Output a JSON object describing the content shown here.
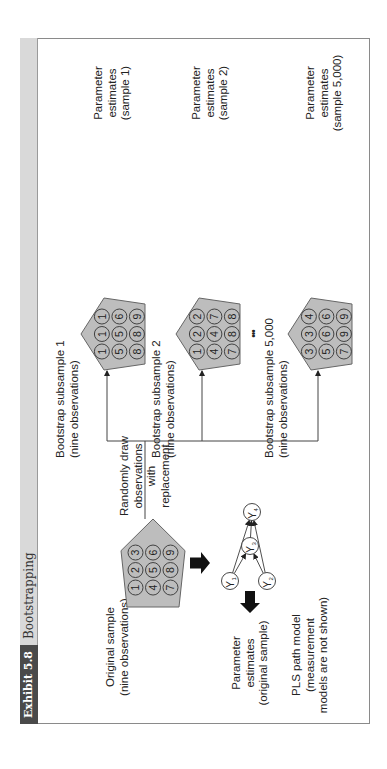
{
  "header": {
    "exhibit_label": "Exhibit 5.8",
    "title": "Bootstrapping"
  },
  "original": {
    "label_line1": "Original sample",
    "label_line2": "(nine observations)",
    "observations": [
      [
        1,
        2,
        3
      ],
      [
        4,
        5,
        6
      ],
      [
        7,
        8,
        9
      ]
    ]
  },
  "draw_label": {
    "line1": "Randomly draw",
    "line2": "observations",
    "line3": "with",
    "line4": "replacement"
  },
  "pls_model": {
    "line1": "PLS path model",
    "line2": "(measurement",
    "line3": "models are not shown)",
    "nodes": [
      "Y1",
      "Y2",
      "Y3",
      "Y4"
    ]
  },
  "original_estimates": {
    "line1": "Parameter",
    "line2": "estimates",
    "line3": "(original sample)"
  },
  "subsamples": [
    {
      "label_line1": "Bootstrap subsample 1",
      "label_line2": "(nine observations)",
      "observations": [
        [
          1,
          1,
          1
        ],
        [
          5,
          5,
          6
        ],
        [
          8,
          8,
          9
        ]
      ],
      "estimates_line1": "Parameter",
      "estimates_line2": "estimates",
      "estimates_line3": "(sample 1)"
    },
    {
      "label_line1": "Bootstrap subsample 2",
      "label_line2": "(nine observations)",
      "observations": [
        [
          1,
          2,
          2
        ],
        [
          4,
          4,
          7
        ],
        [
          7,
          8,
          8
        ]
      ],
      "estimates_line1": "Parameter",
      "estimates_line2": "estimates",
      "estimates_line3": "(sample 2)"
    },
    {
      "label_line1": "Bootstrap subsample 5,000",
      "label_line2": "(nine observations)",
      "observations": [
        [
          3,
          3,
          4
        ],
        [
          5,
          6,
          6
        ],
        [
          7,
          9,
          9
        ]
      ],
      "estimates_line1": "Parameter",
      "estimates_line2": "estimates",
      "estimates_line3": "(sample 5,000)"
    }
  ],
  "ellipsis": "•••",
  "colors": {
    "pentagon_fill": "#bdbdbd",
    "header_dark": "#4a4a4a",
    "header_light": "#d9d9d9",
    "arrow": "#111111"
  }
}
